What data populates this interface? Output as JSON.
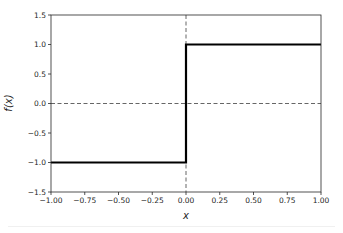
{
  "chart_data": {
    "type": "line",
    "title": "",
    "xlabel": "x",
    "ylabel": "f(x)",
    "xlim": [
      -1.0,
      1.0
    ],
    "ylim": [
      -1.5,
      1.5
    ],
    "xticks": [
      "−1.00",
      "−0.75",
      "−0.50",
      "−0.25",
      "0.00",
      "0.25",
      "0.50",
      "0.75",
      "1.00"
    ],
    "xtick_values": [
      -1.0,
      -0.75,
      -0.5,
      -0.25,
      0.0,
      0.25,
      0.5,
      0.75,
      1.0
    ],
    "yticks": [
      "−1.5",
      "−1.0",
      "−0.5",
      "0.0",
      "0.5",
      "1.0",
      "1.5"
    ],
    "ytick_values": [
      -1.5,
      -1.0,
      -0.5,
      0.0,
      0.5,
      1.0,
      1.5
    ],
    "grid": false,
    "legend": null,
    "series": [
      {
        "name": "sign(x)",
        "style": "solid",
        "color": "#000000",
        "x": [
          -1.0,
          0.0,
          0.0,
          1.0
        ],
        "y": [
          -1.0,
          -1.0,
          1.0,
          1.0
        ]
      }
    ],
    "reference_lines": [
      {
        "orientation": "horizontal",
        "value": 0.0,
        "style": "dashed",
        "color": "#555555"
      },
      {
        "orientation": "vertical",
        "value": 0.0,
        "style": "dashed",
        "color": "#555555"
      }
    ]
  },
  "colors": {
    "line": "#000000",
    "axes": "#262626",
    "reference": "#555555"
  }
}
